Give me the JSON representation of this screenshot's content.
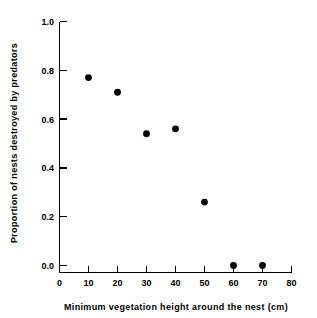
{
  "chart_data": {
    "type": "scatter",
    "title": "",
    "xlabel": "Minimum vegetation height around the nest (cm)",
    "ylabel": "Proportion of nests destroyed by predators",
    "x": [
      10,
      20,
      30,
      40,
      50,
      60,
      70
    ],
    "values": [
      0.77,
      0.71,
      0.54,
      0.56,
      0.26,
      0.0,
      0.0
    ],
    "points": [
      {
        "x": 10,
        "y": 0.77
      },
      {
        "x": 20,
        "y": 0.71
      },
      {
        "x": 30,
        "y": 0.54
      },
      {
        "x": 40,
        "y": 0.56
      },
      {
        "x": 50,
        "y": 0.26
      },
      {
        "x": 60,
        "y": 0.0
      },
      {
        "x": 70,
        "y": 0.0
      }
    ],
    "xlim": [
      0,
      80
    ],
    "ylim": [
      0,
      1.0
    ],
    "xticks": [
      0,
      10,
      20,
      30,
      40,
      50,
      60,
      70,
      80
    ],
    "yticks": [
      0.0,
      0.2,
      0.4,
      0.6,
      0.8,
      1.0
    ],
    "xtick_labels": [
      "0",
      "10",
      "20",
      "30",
      "40",
      "50",
      "60",
      "70",
      "80"
    ],
    "ytick_labels": [
      "0.0",
      "0.2",
      "0.4",
      "0.6",
      "0.8",
      "1.0"
    ],
    "grid": false,
    "legend": null,
    "marker": "filled-circle",
    "marker_color": "#000000",
    "background_color": "#ffffff"
  },
  "axes": {
    "x_title": "Minimum vegetation height around the nest (cm)",
    "y_title": "Proportion of nests destroyed by predators"
  }
}
